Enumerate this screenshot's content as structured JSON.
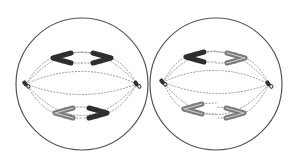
{
  "diagram": {
    "colors": {
      "background": "#ffffff",
      "membrane": "#555555",
      "spindle": "#9a9a9a",
      "chromosome_fill_dark": "#2e2e2e",
      "chromosome_fill_light": "#7a7a7a",
      "centriole": "#333333"
    },
    "cells": [
      {
        "id": "cell-left",
        "center": [
          82,
          84
        ],
        "radius": 66,
        "poles": [
          [
            26,
            84
          ],
          [
            137,
            84
          ]
        ],
        "chromosomes": [
          {
            "position": "upper-left",
            "x": 62,
            "y": 58,
            "opens": "right",
            "shade": "dark"
          },
          {
            "position": "upper-right",
            "x": 102,
            "y": 58,
            "opens": "left",
            "shade": "dark"
          },
          {
            "position": "lower-left",
            "x": 64,
            "y": 113,
            "opens": "right",
            "shade": "light"
          },
          {
            "position": "lower-right",
            "x": 98,
            "y": 113,
            "opens": "left",
            "shade": "dark"
          }
        ]
      },
      {
        "id": "cell-right",
        "center": [
          216,
          84
        ],
        "radius": 66,
        "poles": [
          [
            163,
            82
          ],
          [
            269,
            84
          ]
        ],
        "chromosomes": [
          {
            "position": "upper-left",
            "x": 195,
            "y": 57,
            "opens": "right",
            "shade": "dark"
          },
          {
            "position": "upper-right",
            "x": 236,
            "y": 58,
            "opens": "left",
            "shade": "light"
          },
          {
            "position": "lower-left",
            "x": 193,
            "y": 109,
            "opens": "right",
            "shade": "light"
          },
          {
            "position": "lower-right",
            "x": 235,
            "y": 113,
            "opens": "left",
            "shade": "light"
          }
        ]
      }
    ]
  }
}
